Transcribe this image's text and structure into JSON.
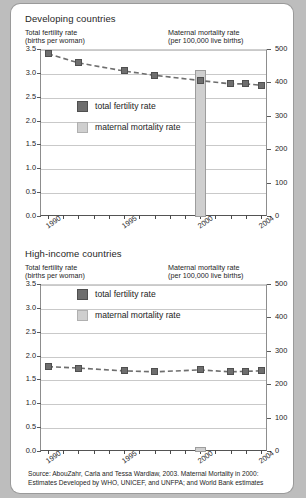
{
  "figure": {
    "source_line1": "Source: AbouZahr, Carla and Tessa Wardlaw, 2003.  Maternal Mortality in 2000:",
    "source_line2": "Estimates Developed by WHO, UNICEF, and UNFPA; and World Bank estimates"
  },
  "legend": {
    "fertility_label": "total fertility rate",
    "mortality_label": "maternal mortality rate",
    "fertility_color": "#6e6e6e",
    "mortality_color": "#cfcfcf"
  },
  "axis_captions": {
    "left_line1": "Total fertility rate",
    "left_line2": "(births per woman)",
    "right_line1": "Maternal mortality rate",
    "right_line2": "(per 100,000 live births)"
  },
  "chart_data": [
    {
      "type": "line",
      "title": "Developing countries",
      "xlabel": "",
      "ylabel": "Total fertility rate (births per woman)",
      "y2label": "Maternal mortality rate (per 100,000 live births)",
      "ylim": [
        0.0,
        3.5
      ],
      "y2lim": [
        0,
        500
      ],
      "grid": true,
      "legend_position": "inside-center-left",
      "x": [
        1990,
        1991,
        1992,
        1993,
        1994,
        1995,
        1996,
        1997,
        1998,
        1999,
        2000,
        2001,
        2002,
        2003,
        2004
      ],
      "xtick_labels": [
        "1990",
        "1995",
        "2000",
        "2004"
      ],
      "xtick_label_years": [
        1990,
        1995,
        2000,
        2004
      ],
      "ytick_labels": [
        "0.0",
        "0.5",
        "1.0",
        "1.5",
        "2.0",
        "2.5",
        "3.0",
        "3.5"
      ],
      "ytick_values": [
        0.0,
        0.5,
        1.0,
        1.5,
        2.0,
        2.5,
        3.0,
        3.5
      ],
      "y2tick_labels": [
        "0",
        "100",
        "200",
        "300",
        "400",
        "500"
      ],
      "y2tick_values": [
        0,
        100,
        200,
        300,
        400,
        500
      ],
      "series": [
        {
          "name": "total fertility rate",
          "axis": "left",
          "marker": "square",
          "linestyle": "dashed",
          "color": "#6e6e6e",
          "points": [
            {
              "x": 1990,
              "y": 3.42
            },
            {
              "x": 1992,
              "y": 3.23
            },
            {
              "x": 1995,
              "y": 3.06
            },
            {
              "x": 1997,
              "y": 2.97
            },
            {
              "x": 2000,
              "y": 2.86
            },
            {
              "x": 2002,
              "y": 2.79
            },
            {
              "x": 2003,
              "y": 2.79
            },
            {
              "x": 2004,
              "y": 2.76
            }
          ]
        },
        {
          "name": "maternal mortality rate",
          "axis": "right",
          "type": "bar",
          "color": "#cfcfcf",
          "points": [
            {
              "x": 2000,
              "y": 440
            }
          ]
        }
      ]
    },
    {
      "type": "line",
      "title": "High-income countries",
      "xlabel": "",
      "ylabel": "Total fertility rate (births per woman)",
      "y2label": "Maternal mortality rate (per 100,000 live births)",
      "ylim": [
        0.0,
        3.5
      ],
      "y2lim": [
        0,
        500
      ],
      "grid": true,
      "legend_position": "inside-top-center",
      "x": [
        1990,
        1991,
        1992,
        1993,
        1994,
        1995,
        1996,
        1997,
        1998,
        1999,
        2000,
        2001,
        2002,
        2003,
        2004
      ],
      "xtick_labels": [
        "1990",
        "1995",
        "2000",
        "2004"
      ],
      "xtick_label_years": [
        1990,
        1995,
        2000,
        2004
      ],
      "ytick_labels": [
        "0.0",
        "0.5",
        "1.0",
        "1.5",
        "2.0",
        "2.5",
        "3.0",
        "3.5"
      ],
      "ytick_values": [
        0.0,
        0.5,
        1.0,
        1.5,
        2.0,
        2.5,
        3.0,
        3.5
      ],
      "y2tick_labels": [
        "0",
        "100",
        "200",
        "300",
        "400",
        "500"
      ],
      "y2tick_values": [
        0,
        100,
        200,
        300,
        400,
        500
      ],
      "series": [
        {
          "name": "total fertility rate",
          "axis": "left",
          "marker": "square",
          "linestyle": "dashed",
          "color": "#6e6e6e",
          "points": [
            {
              "x": 1990,
              "y": 1.79
            },
            {
              "x": 1992,
              "y": 1.76
            },
            {
              "x": 1995,
              "y": 1.7
            },
            {
              "x": 1997,
              "y": 1.68
            },
            {
              "x": 2000,
              "y": 1.72
            },
            {
              "x": 2002,
              "y": 1.68
            },
            {
              "x": 2003,
              "y": 1.69
            },
            {
              "x": 2004,
              "y": 1.7
            }
          ]
        },
        {
          "name": "maternal mortality rate",
          "axis": "right",
          "type": "bar",
          "color": "#cfcfcf",
          "points": [
            {
              "x": 2000,
              "y": 14
            }
          ]
        }
      ]
    }
  ]
}
